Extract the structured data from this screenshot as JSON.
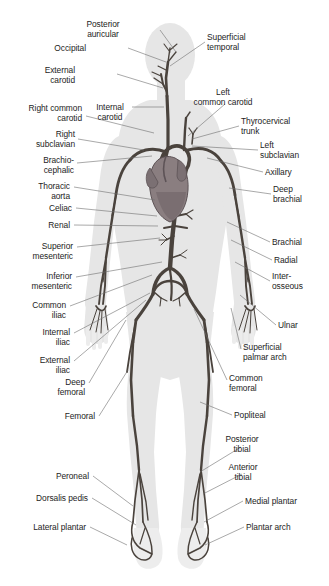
{
  "figure": {
    "colors": {
      "background": "#ffffff",
      "body_silhouette": "#e6e6e6",
      "body_silhouette_edge": "#dcdcdc",
      "artery": "#4a433d",
      "artery_dark": "#3a332e",
      "heart": "#8a7e80",
      "heart_dark": "#6f6466",
      "leader_line": "#6e6e6e",
      "label_text": "#1d1d1d"
    }
  },
  "labels": {
    "left": [
      {
        "id": "posterior-auricular",
        "text": "Posterior\nauricular",
        "x": 103,
        "y": 20,
        "align": "c",
        "line": [
          [
            160,
            30
          ],
          [
            176,
            52
          ]
        ]
      },
      {
        "id": "occipital",
        "text": "Occipital",
        "x": 86,
        "y": 44,
        "align": "r",
        "line": [
          [
            128,
            48
          ],
          [
            166,
            62
          ]
        ]
      },
      {
        "id": "external-carotid",
        "text": "External\ncarotid",
        "x": 75,
        "y": 66,
        "align": "r",
        "line": [
          [
            117,
            74
          ],
          [
            163,
            88
          ]
        ]
      },
      {
        "id": "right-common-carotid",
        "text": "Right common\ncarotid",
        "x": 82,
        "y": 104,
        "align": "r",
        "line": [
          [
            86,
            116
          ],
          [
            154,
            133
          ]
        ]
      },
      {
        "id": "internal-carotid",
        "text": "Internal\ncarotid",
        "x": 110,
        "y": 103,
        "align": "c",
        "line": [
          [
            132,
            107
          ],
          [
            164,
            107
          ]
        ]
      },
      {
        "id": "right-subclavian",
        "text": "Right\nsubclavian",
        "x": 75,
        "y": 130,
        "align": "r",
        "line": [
          [
            78,
            139
          ],
          [
            144,
            150
          ]
        ]
      },
      {
        "id": "brachiocephalic",
        "text": "Brachio-\ncephalic",
        "x": 74,
        "y": 156,
        "align": "r",
        "line": [
          [
            77,
            163
          ],
          [
            152,
            156
          ]
        ]
      },
      {
        "id": "thoracic-aorta",
        "text": "Thoracic\naorta",
        "x": 70,
        "y": 182,
        "align": "r",
        "line": [
          [
            74,
            187
          ],
          [
            155,
            200
          ]
        ]
      },
      {
        "id": "celiac",
        "text": "Celiac",
        "x": 72,
        "y": 204,
        "align": "r",
        "line": [
          [
            76,
            208
          ],
          [
            157,
            216
          ]
        ]
      },
      {
        "id": "renal",
        "text": "Renal",
        "x": 70,
        "y": 221,
        "align": "r",
        "line": [
          [
            74,
            225
          ],
          [
            158,
            226
          ]
        ]
      },
      {
        "id": "superior-mesenteric",
        "text": "Superior\nmesenteric",
        "x": 73,
        "y": 242,
        "align": "r",
        "line": [
          [
            77,
            247
          ],
          [
            160,
            238
          ]
        ]
      },
      {
        "id": "inferior-mesenteric",
        "text": "Inferior\nmesenteric",
        "x": 72,
        "y": 272,
        "align": "r",
        "line": [
          [
            76,
            277
          ],
          [
            162,
            262
          ]
        ]
      },
      {
        "id": "common-iliac",
        "text": "Common\niliac",
        "x": 66,
        "y": 301,
        "align": "r",
        "line": [
          [
            70,
            306
          ],
          [
            152,
            275
          ]
        ]
      },
      {
        "id": "internal-iliac",
        "text": "Internal\niliac",
        "x": 70,
        "y": 328,
        "align": "r",
        "line": [
          [
            74,
            333
          ],
          [
            150,
            293
          ]
        ]
      },
      {
        "id": "external-iliac",
        "text": "External\niliac",
        "x": 70,
        "y": 356,
        "align": "r",
        "line": [
          [
            74,
            361
          ],
          [
            146,
            300
          ]
        ]
      },
      {
        "id": "deep-femoral",
        "text": "Deep\nfemoral",
        "x": 85,
        "y": 378,
        "align": "r",
        "line": [
          [
            89,
            383
          ],
          [
            126,
            320
          ]
        ]
      },
      {
        "id": "femoral",
        "text": "Femoral",
        "x": 95,
        "y": 412,
        "align": "r",
        "line": [
          [
            99,
            416
          ],
          [
            128,
            370
          ]
        ]
      },
      {
        "id": "peroneal",
        "text": "Peroneal",
        "x": 89,
        "y": 472,
        "align": "r",
        "line": [
          [
            93,
            476
          ],
          [
            133,
            506
          ]
        ]
      },
      {
        "id": "dorsalis-pedis",
        "text": "Dorsalis pedis",
        "x": 88,
        "y": 494,
        "align": "r",
        "line": [
          [
            92,
            498
          ],
          [
            136,
            525
          ]
        ]
      },
      {
        "id": "lateral-plantar",
        "text": "Lateral plantar",
        "x": 86,
        "y": 523,
        "align": "r",
        "line": [
          [
            90,
            527
          ],
          [
            127,
            545
          ]
        ]
      }
    ],
    "right": [
      {
        "id": "superficial-temporal",
        "text": "Superficial\ntemporal",
        "x": 207,
        "y": 33,
        "align": "l",
        "line": [
          [
            205,
            42
          ],
          [
            170,
            66
          ]
        ]
      },
      {
        "id": "left-common-carotid",
        "text": "Left\ncommon carotid",
        "x": 223,
        "y": 88,
        "align": "c",
        "line": [
          [
            225,
            104
          ],
          [
            188,
            136
          ]
        ]
      },
      {
        "id": "thyrocervical-trunk",
        "text": "Thyrocervical\ntrunk",
        "x": 241,
        "y": 117,
        "align": "l",
        "line": [
          [
            239,
            126
          ],
          [
            192,
            139
          ]
        ]
      },
      {
        "id": "left-subclavian",
        "text": "Left\nsubclavian",
        "x": 260,
        "y": 141,
        "align": "l",
        "line": [
          [
            258,
            150
          ],
          [
            192,
            146
          ]
        ]
      },
      {
        "id": "axillary",
        "text": "Axillary",
        "x": 265,
        "y": 168,
        "align": "l",
        "line": [
          [
            263,
            172
          ],
          [
            207,
            158
          ]
        ]
      },
      {
        "id": "deep-brachial",
        "text": "Deep\nbrachial",
        "x": 273,
        "y": 185,
        "align": "l",
        "line": [
          [
            271,
            194
          ],
          [
            229,
            188
          ]
        ]
      },
      {
        "id": "brachial",
        "text": "Brachial",
        "x": 272,
        "y": 238,
        "align": "l",
        "line": [
          [
            270,
            242
          ],
          [
            227,
            222
          ]
        ]
      },
      {
        "id": "radial",
        "text": "Radial",
        "x": 274,
        "y": 256,
        "align": "l",
        "line": [
          [
            272,
            260
          ],
          [
            231,
            240
          ]
        ]
      },
      {
        "id": "interosseous",
        "text": "Inter-\nosseous",
        "x": 272,
        "y": 272,
        "align": "l",
        "line": [
          [
            270,
            281
          ],
          [
            235,
            262
          ]
        ]
      },
      {
        "id": "ulnar",
        "text": "Ulnar",
        "x": 278,
        "y": 321,
        "align": "l",
        "line": [
          [
            276,
            325
          ],
          [
            240,
            295
          ]
        ]
      },
      {
        "id": "superficial-palmar-arch",
        "text": "Superficial\npalmar arch",
        "x": 243,
        "y": 343,
        "align": "l",
        "line": [
          [
            241,
            349
          ],
          [
            231,
            308
          ]
        ]
      },
      {
        "id": "common-femoral",
        "text": "Common\nfemoral",
        "x": 229,
        "y": 374,
        "align": "l",
        "line": [
          [
            227,
            380
          ],
          [
            194,
            309
          ]
        ]
      },
      {
        "id": "popliteal",
        "text": "Popliteal",
        "x": 234,
        "y": 411,
        "align": "l",
        "line": [
          [
            232,
            415
          ],
          [
            200,
            402
          ]
        ]
      },
      {
        "id": "posterior-tibial",
        "text": "Posterior\ntibial",
        "x": 242,
        "y": 435,
        "align": "c",
        "line": [
          [
            241,
            447
          ],
          [
            200,
            472
          ]
        ]
      },
      {
        "id": "anterior-tibial",
        "text": "Anterior\ntibial",
        "x": 243,
        "y": 463,
        "align": "c",
        "line": [
          [
            242,
            474
          ],
          [
            203,
            494
          ]
        ]
      },
      {
        "id": "medial-plantar",
        "text": "Medial plantar",
        "x": 245,
        "y": 497,
        "align": "l",
        "line": [
          [
            243,
            501
          ],
          [
            204,
            522
          ]
        ]
      },
      {
        "id": "plantar-arch",
        "text": "Plantar arch",
        "x": 246,
        "y": 523,
        "align": "l",
        "line": [
          [
            244,
            527
          ],
          [
            205,
            545
          ]
        ]
      }
    ]
  }
}
